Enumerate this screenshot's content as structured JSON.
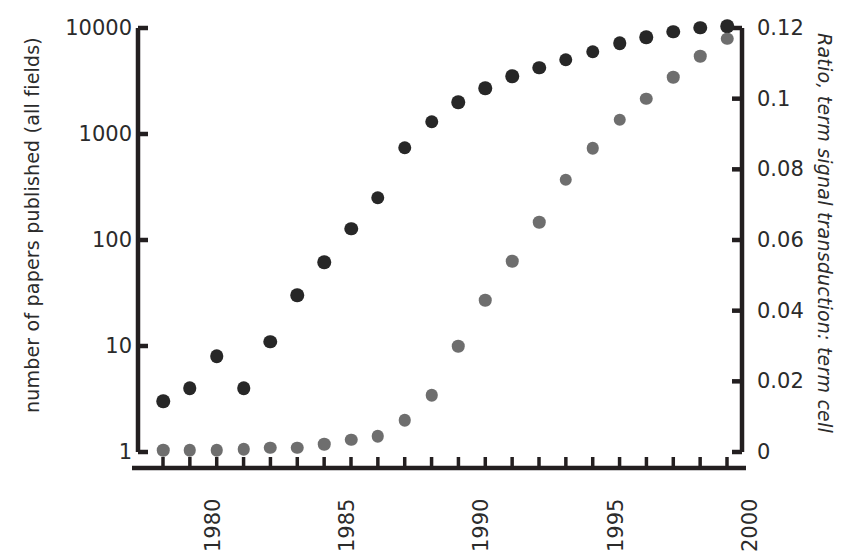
{
  "chart_data": {
    "type": "scatter",
    "title": "",
    "xlabel": "",
    "ylabel": "number of papers published (all fields)",
    "y2label": "Ratio, term signal transduction: term cell",
    "grid": false,
    "legend": "none",
    "x": [
      1979,
      1980,
      1981,
      1982,
      1983,
      1984,
      1985,
      1986,
      1987,
      1988,
      1989,
      1990,
      1991,
      1992,
      1993,
      1994,
      1995,
      1996,
      1997,
      1998,
      1999,
      2000
    ],
    "xlim": [
      1978.5,
      2000.5
    ],
    "xticks": [
      1979,
      1980,
      1981,
      1982,
      1983,
      1984,
      1985,
      1986,
      1987,
      1988,
      1989,
      1990,
      1991,
      1992,
      1993,
      1994,
      1995,
      1996,
      1997,
      1998,
      1999,
      2000
    ],
    "xtick_labels_shown": [
      "1980",
      "1985",
      "1990",
      "1995",
      "2000"
    ],
    "xtick_label_years": [
      1980,
      1985,
      1990,
      1995,
      2000
    ],
    "yaxis_left": {
      "scale": "log",
      "ticks": [
        1,
        10,
        100,
        1000,
        10000
      ],
      "tick_labels": [
        "1",
        "10",
        "100",
        "1000",
        "10000"
      ],
      "ylim": [
        1,
        10000
      ]
    },
    "yaxis_right": {
      "scale": "linear",
      "ticks": [
        0,
        0.02,
        0.04,
        0.06,
        0.08,
        0.1,
        0.12
      ],
      "tick_labels": [
        "0",
        "0.02",
        "0.04",
        "0.06",
        "0.08",
        "0.1",
        "0.12"
      ],
      "ylim": [
        0,
        0.12
      ]
    },
    "series": [
      {
        "name": "number of papers published (all fields)",
        "axis": "left",
        "marker": "circle",
        "color": "#272727",
        "values": [
          3,
          4,
          8,
          4,
          11,
          30,
          62,
          128,
          250,
          740,
          1300,
          2000,
          2700,
          3500,
          4200,
          5000,
          6000,
          7200,
          8200,
          9200,
          10100,
          10400
        ]
      },
      {
        "name": "Ratio, term signal transduction: term cell",
        "axis": "right",
        "marker": "circle",
        "color": "#6e6e6e",
        "values": [
          0.0005,
          0.0005,
          0.0005,
          0.0008,
          0.0012,
          0.0012,
          0.0022,
          0.0035,
          0.0045,
          0.009,
          0.016,
          0.03,
          0.043,
          0.054,
          0.065,
          0.077,
          0.086,
          0.094,
          0.1,
          0.106,
          0.112,
          0.117
        ]
      }
    ]
  },
  "colors": {
    "papers_marker": "#272727",
    "ratio_marker": "#6e6e6e",
    "axis": "#231f20",
    "text": "#2b2b2b",
    "background": "#ffffff"
  }
}
